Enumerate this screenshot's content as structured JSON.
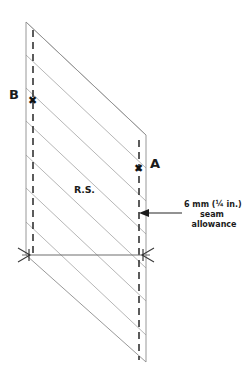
{
  "figure": {
    "kind": "sewing-pattern-diagram",
    "labels": {
      "point_b": "B",
      "point_a": "A",
      "right_side": "R.S.",
      "mark_b": "✖",
      "mark_a": "✖"
    },
    "annotation": {
      "line1": "6 mm (¼ in.)",
      "line2": "seam",
      "line3": "allowance"
    },
    "colors": {
      "ink": "#1b1b1b",
      "outline": "#8d8d8d",
      "dashed": "#2a2a2a",
      "stripe": "#a0a0a0",
      "background": "#ffffff"
    },
    "geometry": {
      "top_left": [
        26,
        22
      ],
      "top_right": [
        146,
        135
      ],
      "bottom_left": [
        26,
        255
      ],
      "bottom_right": [
        146,
        362
      ],
      "left_stitch_x": 33,
      "right_stitch_x": 139,
      "reference_line_y": 255,
      "seam_arrow_y": 213,
      "stripe_count": 7
    }
  }
}
